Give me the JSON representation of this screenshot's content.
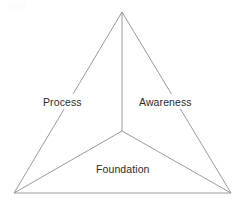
{
  "canvas": {
    "width": 245,
    "height": 209,
    "background_color": "#ffffff"
  },
  "diagram": {
    "type": "triangle-with-central-hub",
    "title": "",
    "line_color": "#9a9a9a",
    "line_width": 1,
    "text_color": "#2b2b2b",
    "vertices": {
      "apex": {
        "x": 122,
        "y": 12
      },
      "bottom_left": {
        "x": 14,
        "y": 193
      },
      "bottom_right": {
        "x": 231,
        "y": 193
      },
      "center": {
        "x": 122,
        "y": 131
      }
    },
    "edges": [
      {
        "name": "left-edge",
        "from": "apex",
        "to": "bottom_left"
      },
      {
        "name": "right-edge",
        "from": "apex",
        "to": "bottom_right"
      },
      {
        "name": "bottom-edge",
        "from": "bottom_left",
        "to": "bottom_right"
      }
    ],
    "spokes": [
      {
        "name": "spoke-top",
        "from": "center",
        "to": "apex"
      },
      {
        "name": "spoke-bottom-left",
        "from": "center",
        "to": "bottom_left"
      },
      {
        "name": "spoke-bottom-right",
        "from": "center",
        "to": "bottom_right"
      }
    ],
    "labels": {
      "left": "Process",
      "right": "Awareness",
      "bottom": "Foundation"
    }
  }
}
